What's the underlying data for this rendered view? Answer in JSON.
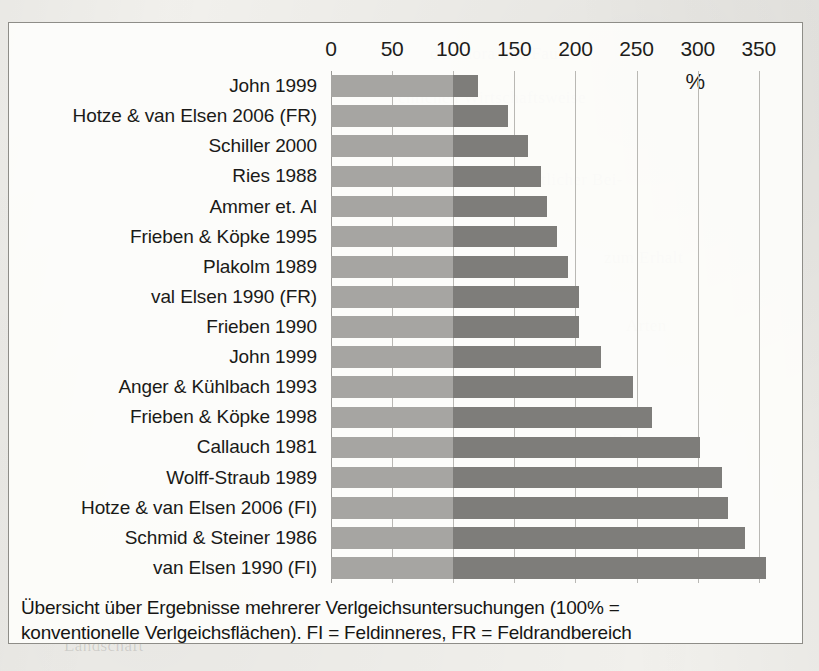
{
  "figure": {
    "unit_label": "%",
    "caption_line1": "Übersicht über Ergebnisse mehrerer Verlgeichsuntersuchungen (100% =",
    "caption_line2": "konventionelle Verlgeichsflächen). FI = Feldinneres, FR = Feldrandbereich"
  },
  "colors": {
    "bar_low": "#a6a5a2",
    "bar_high": "#7e7d7a",
    "gridline": "#b9b8b4",
    "frame": "#8e8d88",
    "text": "#1a1a18",
    "page_background": "#f2f1ed"
  },
  "background_ghost_text": [
    "der Flora und Fauna",
    "chlichen Wirtschaftsweise",
    "ein wesentlicher Bei-",
    "zum Erhalt",
    "Arten",
    "Boden",
    "Landschaft"
  ],
  "chart_data": {
    "type": "bar",
    "orientation": "horizontal",
    "title": "",
    "subtitle": "",
    "xlabel": "%",
    "ylabel": "",
    "xlim": [
      0,
      360
    ],
    "xticks": [
      0,
      50,
      100,
      150,
      200,
      250,
      300,
      350
    ],
    "xtick_labels": [
      "0",
      "50",
      "100",
      "150",
      "200",
      "250",
      "300",
      "350"
    ],
    "grid": true,
    "legend": "none",
    "reference_value": 100,
    "reference_note": "Segment up to 100% drawn in lighter grey; remainder in darker grey",
    "categories": [
      "John 1999",
      "Hotze & van Elsen 2006 (FR)",
      "Schiller 2000",
      "Ries 1988",
      "Ammer et. Al",
      "Frieben & Köpke 1995",
      "Plakolm 1989",
      "val Elsen 1990 (FR)",
      "Frieben 1990",
      "John 1999",
      "Anger & Kühlbach 1993",
      "Frieben & Köpke 1998",
      "Callauch 1981",
      "Wolff-Straub 1989",
      "Hotze & van Elsen 2006 (FI)",
      "Schmid & Steiner 1986",
      "van Elsen 1990 (FI)"
    ],
    "values": [
      120,
      145,
      161,
      172,
      177,
      185,
      194,
      203,
      203,
      221,
      247,
      263,
      302,
      320,
      325,
      339,
      356
    ],
    "value_unit": "%"
  }
}
